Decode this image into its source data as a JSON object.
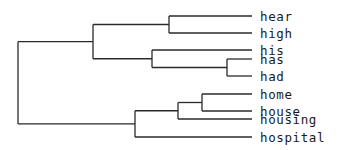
{
  "diagram": {
    "type": "dendrogram",
    "orientation": "left-to-right",
    "leaf_x": 252,
    "label_x": 260,
    "line_color": "#2a2a2a",
    "leaves": [
      {
        "id": "hear",
        "label": "hear",
        "y": 16
      },
      {
        "id": "high",
        "label": "high",
        "y": 33
      },
      {
        "id": "his",
        "label": "his",
        "y": 50
      },
      {
        "id": "has",
        "label": "has",
        "y": 59
      },
      {
        "id": "had",
        "label": "had",
        "y": 76
      },
      {
        "id": "home",
        "label": "home",
        "y": 94
      },
      {
        "id": "house",
        "label": "house",
        "y": 111
      },
      {
        "id": "housing",
        "label": "housing",
        "y": 119
      },
      {
        "id": "hospital",
        "label": "hospital",
        "y": 137
      }
    ],
    "nodes": [
      {
        "id": "n_hear_high",
        "x": 169,
        "children": [
          "hear",
          "high"
        ]
      },
      {
        "id": "n_has_had",
        "x": 227,
        "children": [
          "has",
          "had"
        ]
      },
      {
        "id": "n_his_group",
        "x": 152,
        "children": [
          "his",
          "n_has_had"
        ]
      },
      {
        "id": "n_top",
        "x": 93,
        "children": [
          "n_hear_high",
          "n_his_group"
        ]
      },
      {
        "id": "n_home_house",
        "x": 202,
        "children": [
          "home",
          "house"
        ]
      },
      {
        "id": "n_housing_group",
        "x": 178,
        "children": [
          "n_home_house",
          "housing"
        ]
      },
      {
        "id": "n_bottom",
        "x": 135,
        "children": [
          "n_housing_group",
          "hospital"
        ]
      },
      {
        "id": "n_root",
        "x": 18,
        "children": [
          "n_top",
          "n_bottom"
        ]
      }
    ]
  }
}
